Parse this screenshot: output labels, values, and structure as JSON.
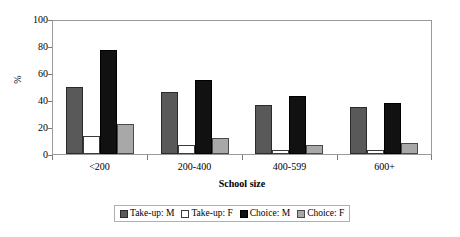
{
  "chart_data": {
    "type": "bar",
    "title": "",
    "xlabel": "School size",
    "ylabel": "%",
    "categories": [
      "<200",
      "200-400",
      "400-599",
      "600+"
    ],
    "series": [
      {
        "name": "Take-up: M",
        "values": [
          50,
          46,
          36,
          35
        ],
        "color": "#595959"
      },
      {
        "name": "Take-up: F",
        "values": [
          13,
          7,
          3,
          3
        ],
        "color": "#ffffff"
      },
      {
        "name": "Choice: M",
        "values": [
          77,
          55,
          43,
          38
        ],
        "color": "#111111"
      },
      {
        "name": "Choice: F",
        "values": [
          22,
          12,
          7,
          8
        ],
        "color": "#a8a8a8"
      }
    ],
    "ylim": [
      0,
      100
    ],
    "yticks": [
      0,
      20,
      40,
      60,
      80,
      100
    ],
    "ytick_labels": [
      "0",
      "20",
      "40",
      "60",
      "80",
      "100"
    ],
    "grid": false,
    "legend_position": "bottom"
  }
}
